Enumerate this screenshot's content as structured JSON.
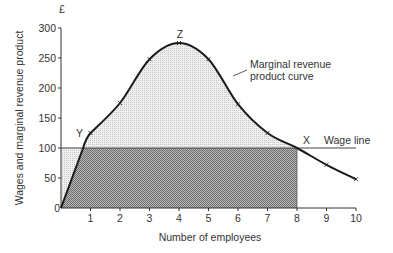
{
  "chart_data": {
    "type": "line",
    "title": "",
    "xlabel": "Number of employees",
    "ylabel": "Wages and marginal revenue product",
    "y_unit_label": "£",
    "xlim": [
      0,
      10
    ],
    "ylim": [
      0,
      300
    ],
    "x_ticks": [
      "0",
      "1",
      "2",
      "3",
      "4",
      "5",
      "6",
      "7",
      "8",
      "9",
      "10"
    ],
    "y_ticks": [
      "0",
      "50",
      "100",
      "150",
      "200",
      "250",
      "300"
    ],
    "grid": false,
    "series": [
      {
        "name": "Marginal revenue product curve",
        "curve_start": {
          "x": 0,
          "y": 0
        },
        "curve_knee": {
          "x": 0.75,
          "y": 100
        },
        "points": [
          {
            "x": 1,
            "y": 125
          },
          {
            "x": 2,
            "y": 175
          },
          {
            "x": 3,
            "y": 248
          },
          {
            "x": 4,
            "y": 275
          },
          {
            "x": 5,
            "y": 248
          },
          {
            "x": 6,
            "y": 173
          },
          {
            "x": 7,
            "y": 125
          },
          {
            "x": 8,
            "y": 100
          },
          {
            "x": 9,
            "y": 72
          },
          {
            "x": 10,
            "y": 48
          }
        ]
      },
      {
        "name": "Wage line",
        "type": "hline",
        "y": 100,
        "x_range": [
          0,
          10
        ]
      }
    ],
    "shaded_regions": [
      {
        "name": "wage-bill-area",
        "x_range": [
          0,
          8
        ],
        "y_range": [
          0,
          100
        ],
        "shade": "dark"
      },
      {
        "name": "surplus-area",
        "under": "Marginal revenue product curve",
        "above": "Wage line",
        "x_range": [
          0,
          8
        ],
        "shade": "light"
      }
    ],
    "annotations": [
      {
        "text": "Y",
        "at": {
          "x": 1,
          "y": 125
        }
      },
      {
        "text": "Z",
        "at": {
          "x": 4,
          "y": 275
        }
      },
      {
        "text": "X",
        "at": {
          "x": 8,
          "y": 100
        }
      },
      {
        "text": "Wage line",
        "at": {
          "x": 9,
          "y": 100
        }
      },
      {
        "text": "Marginal revenue",
        "line": 1
      },
      {
        "text": "product curve",
        "line": 2
      }
    ],
    "colors": {
      "axis": "#333333",
      "curve": "#1a1a1a",
      "dark_shade": "#9a9a9a",
      "light_shade": "#dedede"
    }
  }
}
